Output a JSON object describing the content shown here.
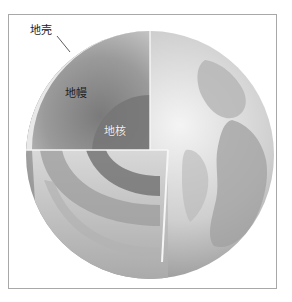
{
  "figure": {
    "labels": {
      "crust": "地壳",
      "mantle": "地幔",
      "core": "地核"
    },
    "colors": {
      "frame_border": "#a8a8a8",
      "crust": "#e6e6e6",
      "mantle": "#8c8c8c",
      "core": "#6e6e6e",
      "surface": "#c8c8c8"
    }
  }
}
